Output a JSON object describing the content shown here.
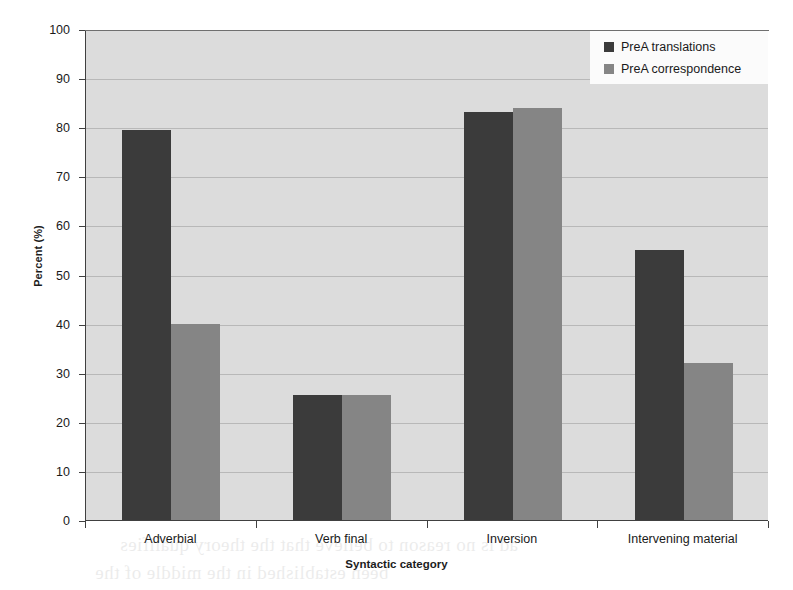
{
  "chart_data": {
    "type": "bar",
    "title": "",
    "xlabel": "Syntactic category",
    "ylabel": "Percent (%)",
    "ylim": [
      0,
      100
    ],
    "ytick_step": 10,
    "yticks": [
      0,
      10,
      20,
      30,
      40,
      50,
      60,
      70,
      80,
      90,
      100
    ],
    "grid": true,
    "legend_position": "top-right",
    "categories": [
      "Adverbial",
      "Verb final",
      "Inversion",
      "Intervening material"
    ],
    "series": [
      {
        "name": "PreA translations",
        "color": "#3b3b3b",
        "values": [
          79.5,
          25.5,
          83,
          55
        ]
      },
      {
        "name": "PreA correspondence",
        "color": "#858585",
        "values": [
          40,
          25.5,
          84,
          32
        ]
      }
    ]
  },
  "axes": {
    "y_title": "Percent (%)",
    "x_title": "Syntactic category",
    "y_tick_labels": [
      "100",
      "90",
      "80",
      "70",
      "60",
      "50",
      "40",
      "30",
      "20",
      "10",
      "0"
    ],
    "x_tick_labels": [
      "Adverbial",
      "Verb final",
      "Inversion",
      "Intervening material"
    ]
  },
  "legend": {
    "items": [
      {
        "label": "PreA translations",
        "color": "#3b3b3b"
      },
      {
        "label": "PreA correspondence",
        "color": "#858585"
      }
    ]
  },
  "scan_artifacts": {
    "bleed_line_1": "ad is no reason to believe that the theory qualifies",
    "bleed_line_2": "been established in the middle of the"
  }
}
